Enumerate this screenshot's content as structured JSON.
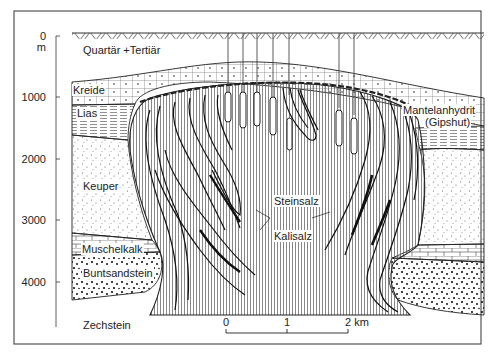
{
  "figure": {
    "type": "geological-cross-section"
  },
  "depth_axis": {
    "unit": "m",
    "ticks": [
      {
        "label": "0",
        "depth": 0
      },
      {
        "label": "1000",
        "depth": 1000
      },
      {
        "label": "2000",
        "depth": 2000
      },
      {
        "label": "3000",
        "depth": 3000
      },
      {
        "label": "4000",
        "depth": 4000
      }
    ]
  },
  "layers": {
    "quartaer_tertiaer": "Quartär +Tertiär",
    "kreide": "Kreide",
    "lias": "Lias",
    "keuper": "Keuper",
    "muschelkalk": "Muschelkalk",
    "buntsandstein": "Buntsandstein",
    "zechstein": "Zechstein"
  },
  "salt_body": {
    "steinsalz": "Steinsalz",
    "kalisalz": "Kalisalz",
    "caprock_line1": "Mantelanhydrit",
    "caprock_line2": "(Gipshut)"
  },
  "scale_bar": {
    "labels": [
      "0",
      "1",
      "2 km"
    ]
  },
  "boreholes": {
    "count": 7
  },
  "colors": {
    "ink": "#222222",
    "background": "#ffffff"
  }
}
